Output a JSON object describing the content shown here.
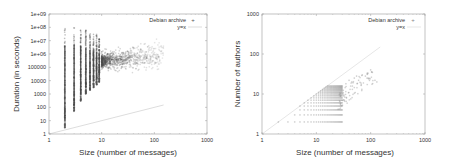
{
  "chart_data": [
    {
      "type": "scatter",
      "title": "",
      "xlabel": "Size (number of messages)",
      "ylabel": "Duration (in seconds)",
      "xscale": "log",
      "yscale": "log",
      "xlim": [
        1,
        1000
      ],
      "ylim": [
        1,
        1000000000
      ],
      "xticks": [
        "1",
        "10",
        "100",
        "1000"
      ],
      "yticks": [
        "1",
        "10",
        "100",
        "1000",
        "10000",
        "100000",
        "1e+06",
        "1e+07",
        "1e+08",
        "1e+09"
      ],
      "grid": false,
      "legend_position": "top-right",
      "series": [
        {
          "name": "Debian archive",
          "marker": "+",
          "color": "#555555",
          "description": "Dense vertical stripes at sizes 2..10; duration spans ~3s to ~1e8s; cloud centered near size 10-30, duration 1e5-1e6; sparse tail to size ~150",
          "columns": [
            {
              "x": 2,
              "ymin": 3,
              "ymax": 80000000
            },
            {
              "x": 3,
              "ymin": 50,
              "ymax": 100000000
            },
            {
              "x": 4,
              "ymin": 300,
              "ymax": 80000000
            },
            {
              "x": 5,
              "ymin": 1000,
              "ymax": 60000000
            },
            {
              "x": 6,
              "ymin": 2000,
              "ymax": 40000000
            },
            {
              "x": 7,
              "ymin": 3000,
              "ymax": 30000000
            },
            {
              "x": 8,
              "ymin": 5000,
              "ymax": 30000000
            },
            {
              "x": 9,
              "ymin": 8000,
              "ymax": 20000000
            }
          ],
          "cloud": {
            "x_range": [
              10,
              150
            ],
            "y_center": 300000,
            "y_spread_decades": 1.5
          }
        },
        {
          "name": "y=x",
          "marker": "line",
          "color": "#bbbbbb",
          "x": [
            1,
            150
          ],
          "y": [
            1,
            150
          ]
        }
      ]
    },
    {
      "type": "scatter",
      "title": "",
      "xlabel": "Size (number of messages)",
      "ylabel": "Number of authors",
      "xscale": "log",
      "yscale": "log",
      "xlim": [
        1,
        1000
      ],
      "ylim": [
        1,
        1000
      ],
      "xticks": [
        "1",
        "10",
        "100",
        "1000"
      ],
      "yticks": [
        "1",
        "10",
        "100",
        "1000"
      ],
      "grid": false,
      "legend_position": "top-right",
      "series": [
        {
          "name": "Debian archive",
          "marker": "+",
          "color": "#888888",
          "description": "Integer lattice of points with authors <= size, filled for sizes 2..30 and authors 2..15; scattered points up to size ~130 and authors ~40",
          "lattice": {
            "x_max": 30,
            "y_max": 16
          },
          "tail": [
            [
              35,
              18
            ],
            [
              40,
              22
            ],
            [
              45,
              20
            ],
            [
              50,
              25
            ],
            [
              55,
              28
            ],
            [
              60,
              22
            ],
            [
              70,
              30
            ],
            [
              80,
              28
            ],
            [
              90,
              25
            ],
            [
              100,
              40
            ],
            [
              120,
              22
            ],
            [
              130,
              20
            ]
          ]
        },
        {
          "name": "y=x",
          "marker": "line",
          "color": "#cccccc",
          "x": [
            1,
            150
          ],
          "y": [
            1,
            150
          ]
        }
      ]
    }
  ]
}
